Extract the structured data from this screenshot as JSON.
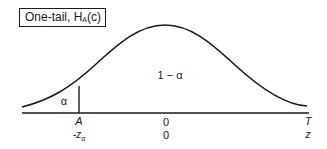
{
  "title": {
    "prefix": "One-tail, H",
    "subscript": "A",
    "suffix": "(c)"
  },
  "regions": {
    "rejection": "α",
    "acceptance": "1 − α"
  },
  "axis": {
    "critical_label": "A",
    "critical_z": "-z",
    "critical_z_sub": "α",
    "center_top": "0",
    "center_bottom": "0",
    "end_top": "T",
    "end_bottom": "z"
  },
  "colors": {
    "line": "#1a1a1a",
    "background": "#ffffff"
  }
}
